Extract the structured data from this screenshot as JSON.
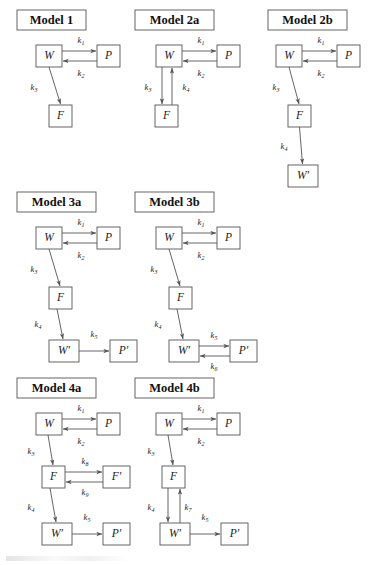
{
  "figure": {
    "background_color": "#ffffff",
    "line_color": "#555555",
    "text_color": "#1a1a1a",
    "node_labels": {
      "W": "W",
      "P": "P",
      "F": "F",
      "W_prime": "W′",
      "P_prime": "P′",
      "F_prime": "F′"
    },
    "rate_constants": {
      "k1": "k",
      "k1_sub": "1",
      "k2": "k",
      "k2_sub": "2",
      "k3": "k",
      "k3_sub": "3",
      "k4": "k",
      "k4_sub": "4",
      "k5": "k",
      "k5_sub": "5",
      "k6": "k",
      "k6_sub": "6",
      "k7": "k",
      "k7_sub": "7",
      "k8": "k",
      "k8_sub": "8",
      "k9": "k",
      "k9_sub": "9"
    }
  },
  "models": [
    {
      "id": "model-1",
      "title": "Model 1",
      "nodes": [
        "W",
        "P",
        "F"
      ],
      "edges": [
        {
          "from": "W",
          "to": "P",
          "rate": "k1"
        },
        {
          "from": "P",
          "to": "W",
          "rate": "k2"
        },
        {
          "from": "W",
          "to": "F",
          "rate": "k3"
        }
      ]
    },
    {
      "id": "model-2a",
      "title": "Model 2a",
      "nodes": [
        "W",
        "P",
        "F"
      ],
      "edges": [
        {
          "from": "W",
          "to": "P",
          "rate": "k1"
        },
        {
          "from": "P",
          "to": "W",
          "rate": "k2"
        },
        {
          "from": "W",
          "to": "F",
          "rate": "k3"
        },
        {
          "from": "F",
          "to": "W",
          "rate": "k4"
        }
      ]
    },
    {
      "id": "model-2b",
      "title": "Model 2b",
      "nodes": [
        "W",
        "P",
        "F",
        "W′"
      ],
      "edges": [
        {
          "from": "W",
          "to": "P",
          "rate": "k1"
        },
        {
          "from": "P",
          "to": "W",
          "rate": "k2"
        },
        {
          "from": "W",
          "to": "F",
          "rate": "k3"
        },
        {
          "from": "F",
          "to": "W′",
          "rate": "k4"
        }
      ]
    },
    {
      "id": "model-3a",
      "title": "Model 3a",
      "nodes": [
        "W",
        "P",
        "F",
        "W′",
        "P′"
      ],
      "edges": [
        {
          "from": "W",
          "to": "P",
          "rate": "k1"
        },
        {
          "from": "P",
          "to": "W",
          "rate": "k2"
        },
        {
          "from": "W",
          "to": "F",
          "rate": "k3"
        },
        {
          "from": "F",
          "to": "W′",
          "rate": "k4"
        },
        {
          "from": "W′",
          "to": "P′",
          "rate": "k5"
        }
      ]
    },
    {
      "id": "model-3b",
      "title": "Model 3b",
      "nodes": [
        "W",
        "P",
        "F",
        "W′",
        "P′"
      ],
      "edges": [
        {
          "from": "W",
          "to": "P",
          "rate": "k1"
        },
        {
          "from": "P",
          "to": "W",
          "rate": "k2"
        },
        {
          "from": "W",
          "to": "F",
          "rate": "k3"
        },
        {
          "from": "F",
          "to": "W′",
          "rate": "k4"
        },
        {
          "from": "W′",
          "to": "P′",
          "rate": "k5"
        },
        {
          "from": "P′",
          "to": "W′",
          "rate": "k6"
        }
      ]
    },
    {
      "id": "model-4a",
      "title": "Model 4a",
      "nodes": [
        "W",
        "P",
        "F",
        "F′",
        "W′",
        "P′"
      ],
      "edges": [
        {
          "from": "W",
          "to": "P",
          "rate": "k1"
        },
        {
          "from": "P",
          "to": "W",
          "rate": "k2"
        },
        {
          "from": "W",
          "to": "F",
          "rate": "k3"
        },
        {
          "from": "F",
          "to": "F′",
          "rate": "k8"
        },
        {
          "from": "F′",
          "to": "F",
          "rate": "k9"
        },
        {
          "from": "F",
          "to": "W′",
          "rate": "k4"
        },
        {
          "from": "W′",
          "to": "P′",
          "rate": "k5"
        }
      ]
    },
    {
      "id": "model-4b",
      "title": "Model 4b",
      "nodes": [
        "W",
        "P",
        "F",
        "W′",
        "P′"
      ],
      "edges": [
        {
          "from": "W",
          "to": "P",
          "rate": "k1"
        },
        {
          "from": "P",
          "to": "W",
          "rate": "k2"
        },
        {
          "from": "W",
          "to": "F",
          "rate": "k3"
        },
        {
          "from": "F",
          "to": "W′",
          "rate": "k4"
        },
        {
          "from": "W′",
          "to": "F",
          "rate": "k7"
        },
        {
          "from": "W′",
          "to": "P′",
          "rate": "k5"
        }
      ]
    }
  ]
}
